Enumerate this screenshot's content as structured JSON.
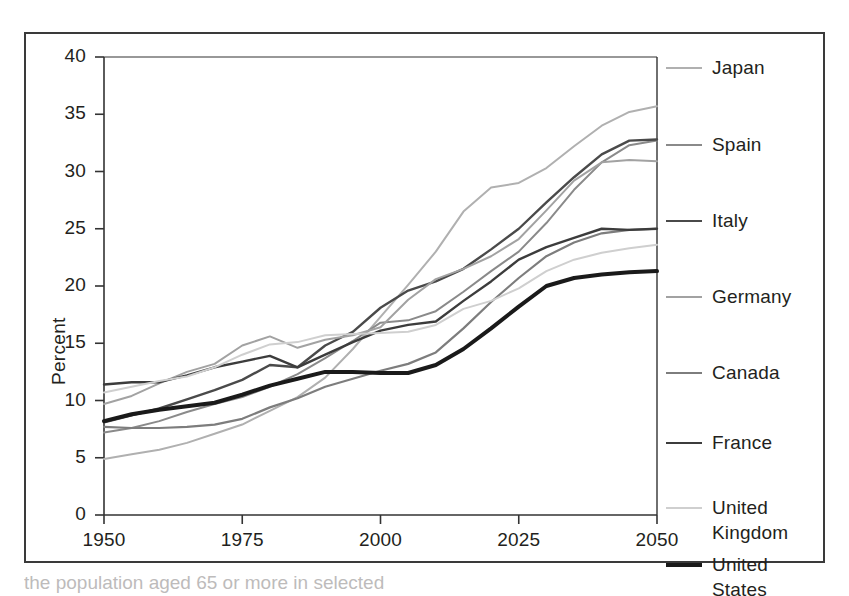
{
  "figure": {
    "caption_fragment": "the population aged 65 or more in selected"
  },
  "axes": {
    "y_title": "Percent",
    "y_ticks": [
      "0",
      "5",
      "10",
      "15",
      "20",
      "25",
      "30",
      "35",
      "40"
    ],
    "x_ticks": [
      "1950",
      "1975",
      "2000",
      "2025",
      "2050"
    ]
  },
  "legend": {
    "entries": [
      {
        "label": "Japan",
        "color": "#b0b0b0",
        "width": 2.0
      },
      {
        "label": "Spain",
        "color": "#8a8a8a",
        "width": 2.0
      },
      {
        "label": "Italy",
        "color": "#4a4a4a",
        "width": 2.4
      },
      {
        "label": "Germany",
        "color": "#a2a2a2",
        "width": 2.0
      },
      {
        "label": "Canada",
        "color": "#7d7d7d",
        "width": 2.2
      },
      {
        "label": "France",
        "color": "#3c3c3c",
        "width": 2.4
      },
      {
        "label": "United\nKingdom",
        "color": "#cfcfcf",
        "width": 2.0
      },
      {
        "label": "United\nStates",
        "color": "#1a1a1a",
        "width": 4.0
      }
    ]
  },
  "chart_data": {
    "type": "line",
    "title": "",
    "xlabel": "",
    "ylabel": "Percent",
    "xlim": [
      1950,
      2050
    ],
    "ylim": [
      0,
      40
    ],
    "y_ticks": [
      0,
      5,
      10,
      15,
      20,
      25,
      30,
      35,
      40
    ],
    "x_ticks": [
      1950,
      1975,
      2000,
      2025,
      2050
    ],
    "grid": false,
    "legend_position": "right",
    "x": [
      1950,
      1955,
      1960,
      1965,
      1970,
      1975,
      1980,
      1985,
      1990,
      1995,
      2000,
      2005,
      2010,
      2015,
      2020,
      2025,
      2030,
      2035,
      2040,
      2045,
      2050
    ],
    "series": [
      {
        "name": "Japan",
        "color": "#b0b0b0",
        "values": [
          4.9,
          5.3,
          5.7,
          6.3,
          7.1,
          7.9,
          9.1,
          10.3,
          12.0,
          14.5,
          17.3,
          20.1,
          23.0,
          26.5,
          28.6,
          29.0,
          30.3,
          32.2,
          34.0,
          35.2,
          35.7
        ]
      },
      {
        "name": "Spain",
        "color": "#8a8a8a",
        "values": [
          7.2,
          7.6,
          8.2,
          9.0,
          9.7,
          10.3,
          11.2,
          12.3,
          13.7,
          15.2,
          16.8,
          17.0,
          17.8,
          19.5,
          21.3,
          23.0,
          25.5,
          28.4,
          30.8,
          32.3,
          32.7
        ]
      },
      {
        "name": "Italy",
        "color": "#4a4a4a",
        "values": [
          8.1,
          8.7,
          9.3,
          10.1,
          10.9,
          11.8,
          13.1,
          12.9,
          14.8,
          16.0,
          18.1,
          19.6,
          20.4,
          21.5,
          23.2,
          25.0,
          27.3,
          29.5,
          31.5,
          32.7,
          32.8
        ]
      },
      {
        "name": "Germany",
        "color": "#a2a2a2",
        "values": [
          9.7,
          10.4,
          11.5,
          12.5,
          13.2,
          14.8,
          15.6,
          14.6,
          15.3,
          15.7,
          16.4,
          18.8,
          20.6,
          21.5,
          22.6,
          24.1,
          26.6,
          29.2,
          30.8,
          31.0,
          30.9
        ]
      },
      {
        "name": "Canada",
        "color": "#7d7d7d",
        "values": [
          7.7,
          7.6,
          7.6,
          7.7,
          7.9,
          8.4,
          9.4,
          10.2,
          11.2,
          11.9,
          12.6,
          13.2,
          14.2,
          16.3,
          18.6,
          20.7,
          22.6,
          23.8,
          24.6,
          24.9,
          25.0
        ]
      },
      {
        "name": "France",
        "color": "#3c3c3c",
        "values": [
          11.4,
          11.6,
          11.6,
          12.2,
          12.9,
          13.4,
          13.9,
          12.9,
          14.0,
          15.1,
          16.1,
          16.6,
          16.9,
          18.7,
          20.4,
          22.3,
          23.4,
          24.2,
          25.0,
          24.9,
          25.0
        ]
      },
      {
        "name": "United Kingdom",
        "color": "#cfcfcf",
        "values": [
          10.7,
          11.2,
          11.7,
          12.1,
          12.9,
          14.0,
          14.9,
          15.1,
          15.7,
          15.8,
          15.9,
          16.0,
          16.6,
          18.0,
          18.7,
          19.8,
          21.3,
          22.3,
          22.9,
          23.3,
          23.6
        ]
      },
      {
        "name": "United States",
        "color": "#1a1a1a",
        "values": [
          8.2,
          8.8,
          9.2,
          9.5,
          9.8,
          10.5,
          11.3,
          11.9,
          12.5,
          12.5,
          12.4,
          12.4,
          13.1,
          14.5,
          16.3,
          18.2,
          20.0,
          20.7,
          21.0,
          21.2,
          21.3
        ]
      }
    ]
  }
}
